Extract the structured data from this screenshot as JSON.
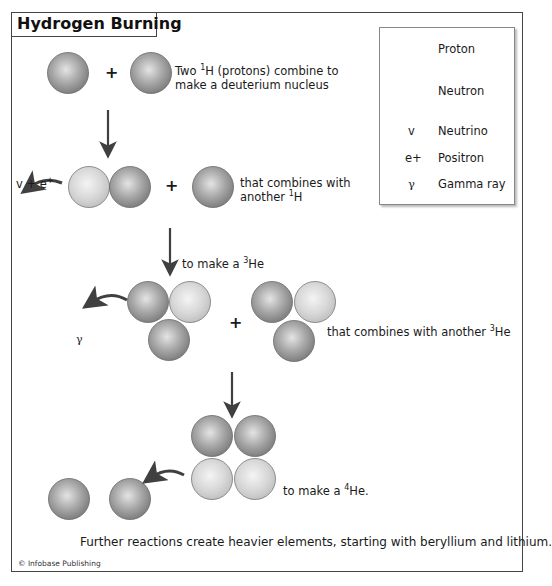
{
  "title": "Hydrogen Burning",
  "legend": {
    "items": [
      {
        "symbol": "proton-sphere",
        "label": "Proton"
      },
      {
        "symbol": "neutron-sphere",
        "label": "Neutron"
      },
      {
        "symbol": "v",
        "label": "Neutrino"
      },
      {
        "symbol": "e+",
        "label": "Positron"
      },
      {
        "symbol": "γ",
        "label": "Gamma ray"
      }
    ]
  },
  "colors": {
    "proton": "#8e8e8e",
    "neutron": "#d4d4d4",
    "arrow": "#404040",
    "frame": "#444444"
  },
  "steps": {
    "step1": {
      "plus": "+",
      "text_pre": "Two ",
      "sup": "1",
      "text_post": "H (protons) combine to",
      "line2": "make a deuterium nucleus"
    },
    "step2": {
      "emitted": "v + e",
      "emitted_sup": "+",
      "plus": "+",
      "line1": "that combines with",
      "line2_pre": "another ",
      "line2_sup": "1",
      "line2_post": "H"
    },
    "step3": {
      "arrow_label_pre": "to make a ",
      "arrow_label_sup": "3",
      "arrow_label_post": "He",
      "emitted": "γ",
      "plus": "+",
      "text_pre": "that combines with another ",
      "text_sup": "3",
      "text_post": "He"
    },
    "step4": {
      "text_pre": "to make a ",
      "text_sup": "4",
      "text_post": "He."
    }
  },
  "footer": "Further reactions create heavier elements, starting with beryllium and lithium.",
  "credit": "© Infobase Publishing"
}
